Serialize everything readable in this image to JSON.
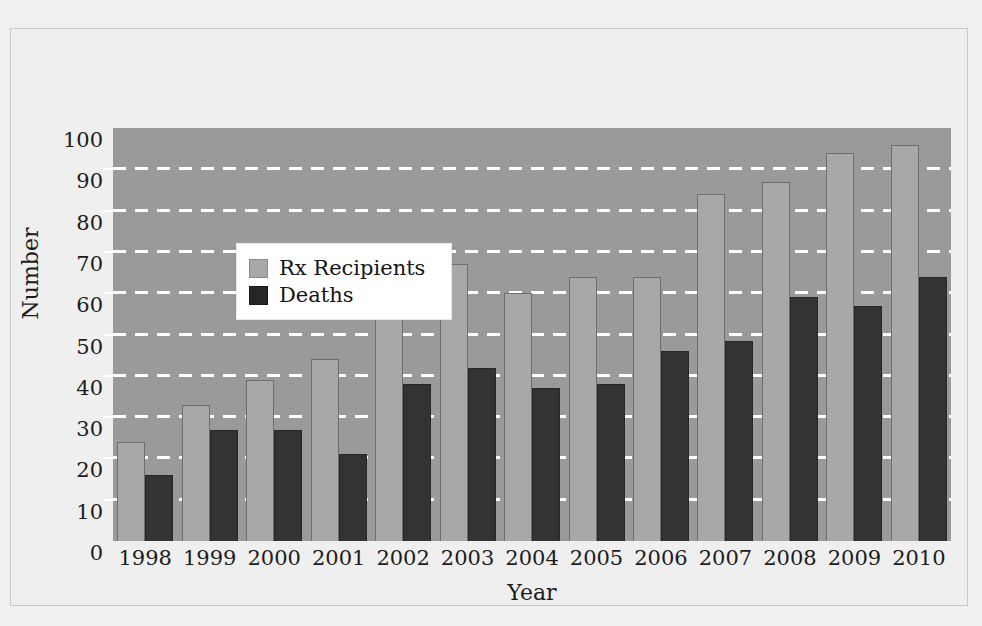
{
  "chart_data": {
    "type": "bar",
    "title": "",
    "xlabel": "Year",
    "ylabel": "Number",
    "categories": [
      "1998",
      "1999",
      "2000",
      "2001",
      "2002",
      "2003",
      "2004",
      "2005",
      "2006",
      "2007",
      "2008",
      "2009",
      "2010"
    ],
    "series": [
      {
        "name": "Rx Recipients",
        "color": "#a8a8a8",
        "values": [
          24,
          33,
          39,
          44,
          58,
          67,
          60,
          64,
          64,
          84,
          87,
          94,
          96
        ]
      },
      {
        "name": "Deaths",
        "color": "#333333",
        "values": [
          16,
          27,
          27,
          21,
          38,
          42,
          37,
          38,
          46,
          48.5,
          59,
          57,
          64
        ]
      }
    ],
    "ylim": [
      0,
      100
    ],
    "ytick_values": [
      0,
      10,
      20,
      30,
      40,
      50,
      60,
      70,
      80,
      90,
      100
    ],
    "ytick_labels": [
      "0",
      "10",
      "20",
      "30",
      "40",
      "50",
      "60",
      "70",
      "80",
      "90",
      "100"
    ],
    "grid": true,
    "grid_style": "dashed-white-horizontal",
    "legend_position": "top-left-inside",
    "plot_background": "#9a9a9a",
    "figure_background": "#f0f0f0"
  },
  "legend": {
    "items": [
      {
        "label": "Rx Recipients"
      },
      {
        "label": "Deaths"
      }
    ]
  }
}
